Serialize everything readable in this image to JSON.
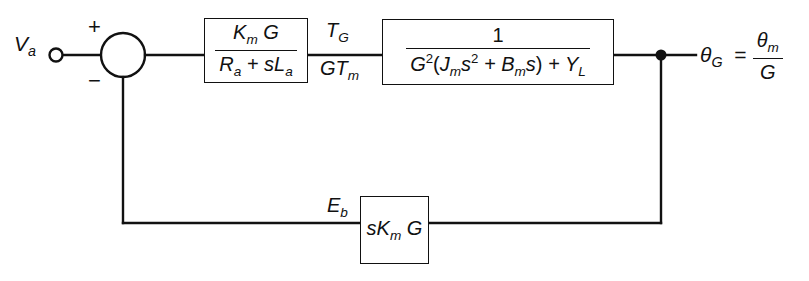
{
  "diagram": {
    "background_color": "#ffffff",
    "line_color": "#111111",
    "input": {
      "name": "armature-voltage",
      "label": "V",
      "subscript": "a",
      "terminal": "open-circle"
    },
    "summing_junction": {
      "name": "summing-junction",
      "plus_sign": "+",
      "minus_sign": "−",
      "shape": "circle",
      "center_x": 123,
      "center_y": 55,
      "radius": 22
    },
    "blocks": [
      {
        "id": "motor",
        "name": "motor-transfer-function-block",
        "type": "transfer-function",
        "numerator": "Kₘ G",
        "denominator": "Rₐ + sLₐ",
        "expression": "K_m G / (R_a + s L_a)"
      },
      {
        "id": "load",
        "name": "load-transfer-function-block",
        "type": "transfer-function",
        "numerator": "1",
        "denominator": "G²(Jₘs² + Bₘs) + Y_L",
        "expression": "1 / (G^2 (J_m s^2 + B_m s) + Y_L)"
      },
      {
        "id": "feedback",
        "name": "back-emf-feedback-block",
        "type": "gain",
        "expression": "s K_m G"
      }
    ],
    "signals": [
      {
        "id": "tg",
        "name": "torque-signal-label",
        "text": "T_G",
        "position": "above-line"
      },
      {
        "id": "gtm",
        "name": "gear-torque-signal-label",
        "text": "GT_m",
        "position": "below-line"
      },
      {
        "id": "eb",
        "name": "back-emf-signal-label",
        "text": "E_b",
        "position": "above-line"
      }
    ],
    "output": {
      "name": "output-angle-label",
      "variable": "θ",
      "subscript": "G",
      "equals": "=",
      "numerator": "θₘ",
      "denominator": "G",
      "expression": "theta_G = theta_m / G"
    },
    "takeoff_point": {
      "name": "feedback-takeoff-node",
      "x": 661,
      "y": 57
    },
    "feedback_path": {
      "name": "feedback-path",
      "bottom_y": 223,
      "left_x": 123,
      "right_x": 661
    }
  }
}
